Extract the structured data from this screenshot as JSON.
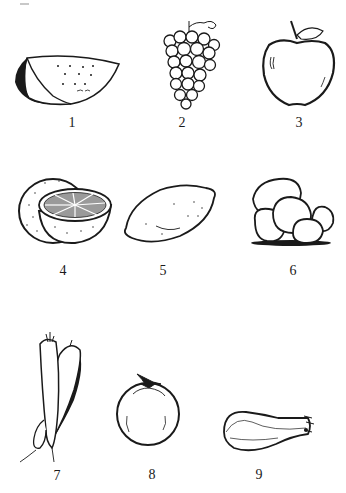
{
  "figures": [
    {
      "number": "1",
      "subject": "melon slice"
    },
    {
      "number": "2",
      "subject": "grapes"
    },
    {
      "number": "3",
      "subject": "apple"
    },
    {
      "number": "4",
      "subject": "orange"
    },
    {
      "number": "5",
      "subject": "lemon"
    },
    {
      "number": "6",
      "subject": "potatoes"
    },
    {
      "number": "7",
      "subject": "carrots"
    },
    {
      "number": "8",
      "subject": "tomato"
    },
    {
      "number": "9",
      "subject": "squash"
    }
  ],
  "colors": {
    "ink": "#1a1a1a",
    "paper": "#ffffff"
  }
}
